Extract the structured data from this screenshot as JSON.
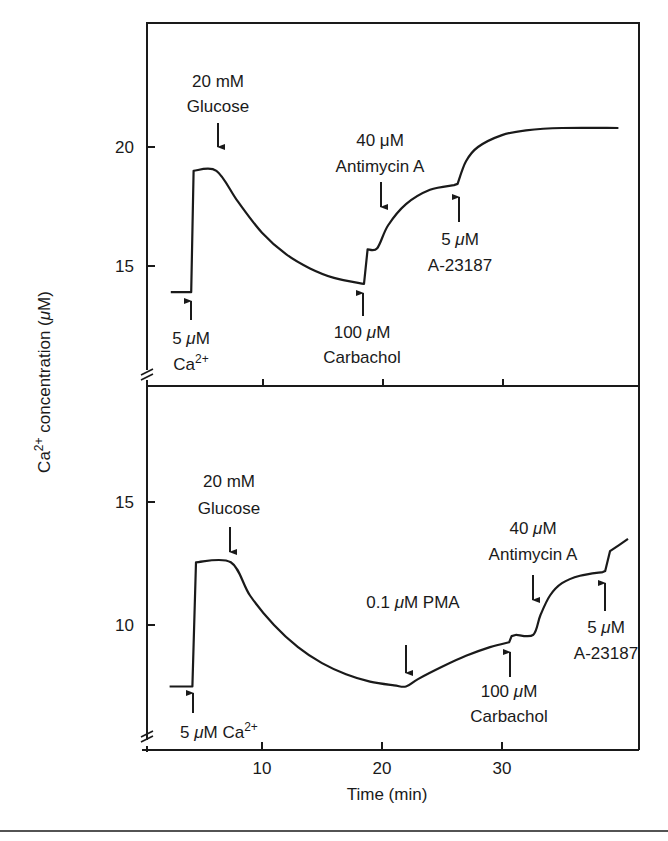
{
  "chart_data": [
    {
      "type": "line",
      "panel": "top",
      "ylabel": "Ca²⁺ concentration (μM)",
      "xlabel": "",
      "y_ticks": [
        15,
        20
      ],
      "ylim": [
        11.2,
        25.3
      ],
      "xlim": [
        0.4,
        41.4
      ],
      "x_ticks": [
        10,
        20,
        30
      ],
      "axis_break": true,
      "grid": false,
      "series": [
        {
          "name": "Ca2+ concentration",
          "x": [
            2.4,
            4.1,
            4.3,
            6.2,
            8,
            10,
            12,
            14,
            16,
            18.5,
            18.8,
            19.6,
            20.5,
            22,
            24,
            26,
            26.3,
            27,
            28,
            30,
            32,
            35,
            39.7
          ],
          "y": [
            13.9,
            13.9,
            19.0,
            19.0,
            17.7,
            16.4,
            15.5,
            14.9,
            14.5,
            14.25,
            15.7,
            15.75,
            16.7,
            17.6,
            18.2,
            18.4,
            18.45,
            19.4,
            20.0,
            20.5,
            20.7,
            20.8,
            20.8
          ]
        }
      ],
      "annotations": [
        {
          "label_lines": [
            "5 μM",
            "Ca²⁺"
          ],
          "t": 4.2,
          "arrow": "up"
        },
        {
          "label_lines": [
            "20 mM",
            "Glucose"
          ],
          "t": 6.2,
          "arrow": "down"
        },
        {
          "label_lines": [
            "100 μM",
            "Carbachol"
          ],
          "t": 18.5,
          "arrow": "up"
        },
        {
          "label_lines": [
            "40 μM",
            "Antimycin A"
          ],
          "t": 19.8,
          "arrow": "down"
        },
        {
          "label_lines": [
            "5 μM",
            "A-23187"
          ],
          "t": 26.3,
          "arrow": "up"
        }
      ]
    },
    {
      "type": "line",
      "panel": "bottom",
      "ylabel": "Ca²⁺ concentration (μM)",
      "xlabel": "Time (min)",
      "y_ticks": [
        10,
        15
      ],
      "ylim": [
        5.0,
        19.9
      ],
      "xlim": [
        0.4,
        41.4
      ],
      "x_ticks": [
        10,
        20,
        30
      ],
      "axis_break": true,
      "grid": false,
      "series": [
        {
          "name": "Ca2+ concentration",
          "x": [
            2.3,
            4.2,
            4.5,
            7.4,
            9,
            11,
            13,
            15,
            17,
            19,
            21,
            22,
            23,
            25,
            27,
            29,
            30.6,
            30.8,
            31.2,
            32.6,
            33.2,
            34,
            35,
            36.5,
            38.4,
            38.6,
            39,
            40.5
          ],
          "y": [
            7.5,
            7.5,
            12.55,
            12.55,
            11.2,
            10.0,
            9.1,
            8.45,
            8.0,
            7.7,
            7.55,
            7.5,
            7.8,
            8.3,
            8.75,
            9.1,
            9.3,
            9.55,
            9.6,
            9.6,
            10.4,
            11.2,
            11.7,
            12.0,
            12.15,
            12.2,
            13.0,
            13.5
          ]
        }
      ],
      "annotations": [
        {
          "label_lines": [
            "5 μM  Ca²⁺"
          ],
          "t": 4.4,
          "arrow": "up"
        },
        {
          "label_lines": [
            "20 mM",
            "Glucose"
          ],
          "t": 7.3,
          "arrow": "down"
        },
        {
          "label_lines": [
            "0.1 μM PMA"
          ],
          "t": 22.0,
          "arrow": "down"
        },
        {
          "label_lines": [
            "100 μM",
            "Carbachol"
          ],
          "t": 30.7,
          "arrow": "up"
        },
        {
          "label_lines": [
            "40 μM",
            "Antimycin A"
          ],
          "t": 32.6,
          "arrow": "down"
        },
        {
          "label_lines": [
            "5 μM",
            "A-23187"
          ],
          "t": 38.5,
          "arrow": "up"
        }
      ]
    }
  ],
  "labels": {
    "y_axis_prefix": "Ca",
    "y_axis_sup": "2+",
    "y_axis_rest": " concentration (",
    "y_axis_mu": "μ",
    "y_axis_unit": "M)",
    "x_axis": "Time (min)",
    "top_ticks": {
      "y20": "20",
      "y15": "15"
    },
    "bottom_ticks": {
      "y15": "15",
      "y10": "10"
    },
    "x_ticks": {
      "t10": "10",
      "t20": "20",
      "t30": "30"
    },
    "top": {
      "ca_l1_num": "5 ",
      "ca_l1_mu": "μ",
      "ca_l1_unit": "M",
      "ca_l2": "Ca",
      "ca_l2_sup": "2+",
      "glu_l1": "20 mM",
      "glu_l2": "Glucose",
      "carb_l1_num": "100 ",
      "carb_l1_mu": "μ",
      "carb_l1_unit": "M",
      "carb_l2": "Carbachol",
      "anti_l1_num": "40 ",
      "anti_l1_mu": "μ",
      "anti_l1_unit": "M",
      "anti_l2": "Antimycin A",
      "a23_l1_num": "5 ",
      "a23_l1_mu": "μ",
      "a23_l1_unit": "M",
      "a23_l2": "A-23187"
    },
    "bottom": {
      "ca_num": "5 ",
      "ca_mu": "μ",
      "ca_unit": "M  Ca",
      "ca_sup": "2+",
      "glu_l1": "20 mM",
      "glu_l2": "Glucose",
      "pma_num": "0.1 ",
      "pma_mu": "μ",
      "pma_unit": "M PMA",
      "carb_l1_num": "100 ",
      "carb_l1_mu": "μ",
      "carb_l1_unit": "M",
      "carb_l2": "Carbachol",
      "anti_l1_num": "40 ",
      "anti_l1_mu": "μ",
      "anti_l1_unit": "M",
      "anti_l2": "Antimycin A",
      "a23_l1_num": "5 ",
      "a23_l1_mu": "μ",
      "a23_l1_unit": "M",
      "a23_l2": "A-23187"
    }
  },
  "colors": {
    "ink": "#1a1a1a",
    "background": "#ffffff"
  }
}
